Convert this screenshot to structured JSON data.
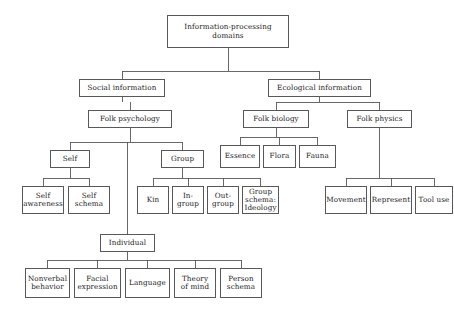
{
  "diagram": {
    "title": "Information-processing domains",
    "type": "hierarchy-tree",
    "box_border_color": "#58585a",
    "background_color": "#ffffff",
    "text_color": "#1a1a1a",
    "nodes": [
      {
        "id": "root",
        "label": "Information-processing\ndomains",
        "x": 167,
        "y": 15,
        "w": 122,
        "h": 33,
        "font_size": 7.2
      },
      {
        "id": "social",
        "label": "Social information",
        "x": 79,
        "y": 79,
        "w": 86,
        "h": 18,
        "font_size": 7.2
      },
      {
        "id": "ecological",
        "label": "Ecological information",
        "x": 268,
        "y": 79,
        "w": 103,
        "h": 18,
        "font_size": 7.2
      },
      {
        "id": "folk_psychology",
        "label": "Folk psychology",
        "x": 88,
        "y": 110,
        "w": 84,
        "h": 18,
        "font_size": 7.2
      },
      {
        "id": "folk_biology",
        "label": "Folk biology",
        "x": 243,
        "y": 110,
        "w": 66,
        "h": 18,
        "font_size": 7.2
      },
      {
        "id": "folk_physics",
        "label": "Folk physics",
        "x": 347,
        "y": 110,
        "w": 65,
        "h": 18,
        "font_size": 7.2
      },
      {
        "id": "self",
        "label": "Self",
        "x": 50,
        "y": 150,
        "w": 40,
        "h": 18,
        "font_size": 7.2
      },
      {
        "id": "group",
        "label": "Group",
        "x": 161,
        "y": 150,
        "w": 43,
        "h": 18,
        "font_size": 7.2
      },
      {
        "id": "essence",
        "label": "Essence",
        "x": 220,
        "y": 145,
        "w": 40,
        "h": 23,
        "font_size": 7.2
      },
      {
        "id": "flora",
        "label": "Flora",
        "x": 263,
        "y": 145,
        "w": 33,
        "h": 23,
        "font_size": 7.2
      },
      {
        "id": "fauna",
        "label": "Fauna",
        "x": 299,
        "y": 145,
        "w": 37,
        "h": 23,
        "font_size": 7.2
      },
      {
        "id": "self_awareness",
        "label": "Self\nawareness",
        "x": 22,
        "y": 186,
        "w": 42,
        "h": 28,
        "font_size": 7.2
      },
      {
        "id": "self_schema",
        "label": "Self\nschema",
        "x": 68,
        "y": 186,
        "w": 42,
        "h": 28,
        "font_size": 7.2
      },
      {
        "id": "kin",
        "label": "Kin",
        "x": 137,
        "y": 186,
        "w": 32,
        "h": 28,
        "font_size": 7.2
      },
      {
        "id": "in_group",
        "label": "In-\ngroup",
        "x": 172,
        "y": 186,
        "w": 32,
        "h": 28,
        "font_size": 7.2
      },
      {
        "id": "out_group",
        "label": "Out-\ngroup",
        "x": 207,
        "y": 186,
        "w": 32,
        "h": 28,
        "font_size": 7.2
      },
      {
        "id": "group_schema",
        "label": "Group\nschema:\nIdeology",
        "x": 242,
        "y": 186,
        "w": 37,
        "h": 28,
        "font_size": 7.2
      },
      {
        "id": "movement",
        "label": "Movement",
        "x": 325,
        "y": 186,
        "w": 42,
        "h": 28,
        "font_size": 7.2
      },
      {
        "id": "represent",
        "label": "Represent",
        "x": 370,
        "y": 186,
        "w": 42,
        "h": 28,
        "font_size": 7.2
      },
      {
        "id": "tool_use",
        "label": "Tool use",
        "x": 415,
        "y": 186,
        "w": 38,
        "h": 28,
        "font_size": 7.2
      },
      {
        "id": "individual",
        "label": "Individual",
        "x": 100,
        "y": 234,
        "w": 55,
        "h": 18,
        "font_size": 7.2
      },
      {
        "id": "nonverbal",
        "label": "Nonverbal\nbehavior",
        "x": 25,
        "y": 268,
        "w": 45,
        "h": 30,
        "font_size": 7.2
      },
      {
        "id": "facial",
        "label": "Facial\nexpression",
        "x": 74,
        "y": 268,
        "w": 47,
        "h": 30,
        "font_size": 7.2
      },
      {
        "id": "language",
        "label": "Language",
        "x": 125,
        "y": 268,
        "w": 45,
        "h": 30,
        "font_size": 7.2
      },
      {
        "id": "theory_of_mind",
        "label": "Theory\nof mind",
        "x": 174,
        "y": 268,
        "w": 42,
        "h": 30,
        "font_size": 7.2
      },
      {
        "id": "person_schema",
        "label": "Person\nschema",
        "x": 220,
        "y": 268,
        "w": 42,
        "h": 30,
        "font_size": 7.2
      }
    ],
    "edges": [
      {
        "from": "root",
        "to": [
          "social",
          "ecological"
        ]
      },
      {
        "from": "social",
        "to": [
          "folk_psychology"
        ]
      },
      {
        "from": "ecological",
        "to": [
          "folk_biology",
          "folk_physics"
        ]
      },
      {
        "from": "folk_psychology",
        "to": [
          "self",
          "group",
          "individual"
        ]
      },
      {
        "from": "folk_biology",
        "to": [
          "essence",
          "flora",
          "fauna"
        ]
      },
      {
        "from": "folk_physics",
        "to": [
          "movement",
          "represent",
          "tool_use"
        ]
      },
      {
        "from": "self",
        "to": [
          "self_awareness",
          "self_schema"
        ]
      },
      {
        "from": "group",
        "to": [
          "kin",
          "in_group",
          "out_group",
          "group_schema"
        ]
      },
      {
        "from": "individual",
        "to": [
          "nonverbal",
          "facial",
          "language",
          "theory_of_mind",
          "person_schema"
        ]
      }
    ]
  }
}
